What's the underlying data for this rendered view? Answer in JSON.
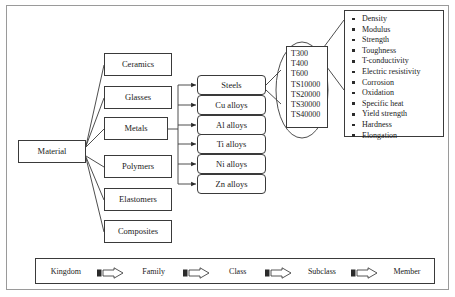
{
  "diagram": {
    "root": {
      "label": "Material"
    },
    "families": [
      {
        "label": "Ceramics"
      },
      {
        "label": "Glasses"
      },
      {
        "label": "Metals"
      },
      {
        "label": "Polymers"
      },
      {
        "label": "Elastomers"
      },
      {
        "label": "Composites"
      }
    ],
    "classes": [
      {
        "label": "Steels"
      },
      {
        "label": "Cu alloys"
      },
      {
        "label": "Al alloys"
      },
      {
        "label": "Ti alloys"
      },
      {
        "label": "Ni alloys"
      },
      {
        "label": "Zn alloys"
      }
    ],
    "subclasses": [
      "T300",
      "T400",
      "T600",
      "TS10000",
      "TS20000",
      "TS30000",
      "TS40000"
    ],
    "members": [
      "Density",
      "Modulus",
      "Strength",
      "Toughness",
      "T-conductivity",
      "Electric resistivity",
      "Corrosion",
      "Oxidation",
      "Specific heat",
      "Yield strength",
      "Hardness",
      "Elongation"
    ],
    "legend": {
      "levels": [
        "Kingdom",
        "Family",
        "Class",
        "Subclass",
        "Member"
      ],
      "arrow_icon": "block-arrow-right-icon"
    },
    "colors": {
      "line": "#3a3a3a",
      "frame": "#9a9a9a",
      "text": "#1a1a1a",
      "background": "#ffffff"
    }
  }
}
